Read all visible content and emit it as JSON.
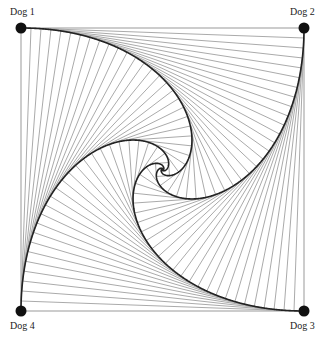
{
  "dogs": [
    {
      "label": "Dog 1",
      "x": 21,
      "y": 28
    },
    {
      "label": "Dog 2",
      "x": 304,
      "y": 28
    },
    {
      "label": "Dog 3",
      "x": 304,
      "y": 311
    },
    {
      "label": "Dog 4",
      "x": 21,
      "y": 311
    }
  ],
  "pursuit": {
    "steps": 4000,
    "step_size": 0.1,
    "line_every": 100,
    "chase_color": "#222222",
    "sight_line_color": "#555555",
    "dot_radius": 5.5
  }
}
